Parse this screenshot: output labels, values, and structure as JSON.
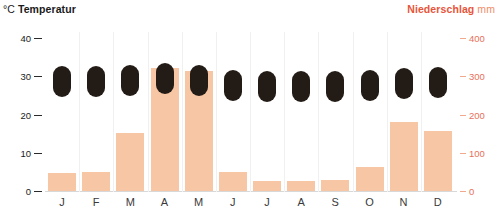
{
  "header": {
    "left_unit": "°C",
    "left_title": "Temperatur",
    "right_title": "Niederschlag",
    "right_unit": "mm"
  },
  "axes": {
    "left_ticks": [
      "40",
      "30",
      "20",
      "10",
      "0"
    ],
    "right_ticks": [
      "400",
      "300",
      "200",
      "100",
      "0"
    ]
  },
  "colors": {
    "bar": "#f7c6a4",
    "temperature_marker": "#231b16",
    "precip_accent": "#e8543a",
    "precip_tick": "#e8705a"
  },
  "chart_data": {
    "type": "bar",
    "subtitle": "",
    "xlabel": "",
    "categories": [
      "J",
      "F",
      "M",
      "A",
      "M",
      "J",
      "J",
      "A",
      "S",
      "O",
      "N",
      "D"
    ],
    "month_labels": [
      "J",
      "F",
      "M",
      "A",
      "M",
      "J",
      "J",
      "A",
      "S",
      "O",
      "N",
      "D"
    ],
    "grid": false,
    "legend": "none",
    "series": [
      {
        "name": "Niederschlag",
        "type": "bar",
        "unit": "mm",
        "axis": "right",
        "ylabel": "Niederschlag mm",
        "ylim": [
          0,
          430
        ],
        "tick_values": [
          0,
          100,
          200,
          300,
          400
        ],
        "values": [
          47,
          50,
          152,
          322,
          314,
          50,
          25,
          27,
          28,
          63,
          180,
          157
        ]
      },
      {
        "name": "Temperatur",
        "type": "marker",
        "unit": "°C",
        "axis": "left",
        "ylabel": "°C Temperatur",
        "ylim": [
          0,
          43
        ],
        "tick_values": [
          0,
          10,
          20,
          30,
          40
        ],
        "values": [
          28.5,
          28.5,
          28.8,
          29.5,
          28.8,
          27.6,
          27.2,
          27.2,
          27.4,
          27.6,
          28.0,
          28.2
        ]
      }
    ]
  }
}
